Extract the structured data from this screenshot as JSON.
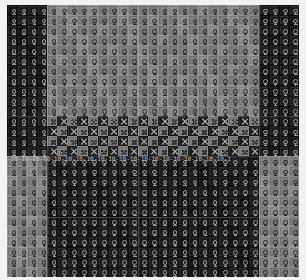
{
  "canvas": {
    "width": 306,
    "height": 280,
    "background": "#ffffff",
    "board_left": 7,
    "board_top": 5,
    "board_width": 292,
    "board_height": 272
  },
  "texture": {
    "title": "Tiled glyph texture",
    "cell_size": 10,
    "columns": 29,
    "rows": 27,
    "glyph_names": [
      "venus-ring-glyph",
      "x-cross-glyph",
      "speckle-glyph"
    ],
    "palette": {
      "dark": "#141414",
      "extra_dark": "#0d0d0d",
      "mid": "#4a4a4a",
      "light": "#8a8a8a",
      "extra_light": "#9a9a9a",
      "glyph_on_dark": "#9d9d9d",
      "glyph_on_light": "#2a2a2a",
      "seam": "#c8c8c8",
      "page": "#ffffff"
    }
  },
  "regions": [
    {
      "name": "top-left-dark-block",
      "tone": "dark",
      "col_start": 0,
      "col_end": 4,
      "row_start": 0,
      "row_end": 11,
      "glyph": "venus-ring-glyph"
    },
    {
      "name": "top-center-light-block",
      "tone": "light",
      "col_start": 4,
      "col_end": 25,
      "row_start": 0,
      "row_end": 11,
      "glyph": "venus-ring-glyph"
    },
    {
      "name": "top-right-dark-block",
      "tone": "dark",
      "col_start": 25,
      "col_end": 29,
      "row_start": 0,
      "row_end": 11,
      "glyph": "venus-ring-glyph"
    },
    {
      "name": "mid-left-dark-block",
      "tone": "dark",
      "col_start": 0,
      "col_end": 4,
      "row_start": 11,
      "row_end": 15,
      "glyph": "venus-ring-glyph"
    },
    {
      "name": "mid-band-checker",
      "tone": "mixed",
      "col_start": 4,
      "col_end": 25,
      "row_start": 11,
      "row_end": 15,
      "glyph": "x-cross-glyph"
    },
    {
      "name": "mid-right-dark-block",
      "tone": "dark",
      "col_start": 25,
      "col_end": 29,
      "row_start": 11,
      "row_end": 15,
      "glyph": "venus-ring-glyph"
    },
    {
      "name": "bottom-left-light-block",
      "tone": "light",
      "col_start": 0,
      "col_end": 4,
      "row_start": 15,
      "row_end": 27,
      "glyph": "venus-ring-glyph"
    },
    {
      "name": "bottom-center-dark-block",
      "tone": "dark",
      "col_start": 4,
      "col_end": 25,
      "row_start": 15,
      "row_end": 27,
      "glyph": "venus-ring-glyph"
    },
    {
      "name": "bottom-right-light-block",
      "tone": "light",
      "col_start": 25,
      "col_end": 29,
      "row_start": 15,
      "row_end": 27,
      "glyph": "venus-ring-glyph"
    }
  ],
  "seams": {
    "vertical_columns": [
      4,
      13,
      25
    ],
    "horizontal_rows": [
      11,
      15,
      21
    ]
  },
  "band_strip": {
    "name": "divider-strip",
    "row": 15,
    "repeat_text": "-10-10-10-10-10-10-10-10-10-10-10-10-10-10-10-10-10-10-10-10-1"
  }
}
